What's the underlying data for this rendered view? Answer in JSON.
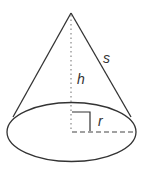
{
  "diagram": {
    "labels": {
      "height": "h",
      "slant": "s",
      "radius": "r"
    },
    "colors": {
      "stroke": "#333333",
      "dotted": "#888888",
      "background": "#ffffff"
    }
  }
}
